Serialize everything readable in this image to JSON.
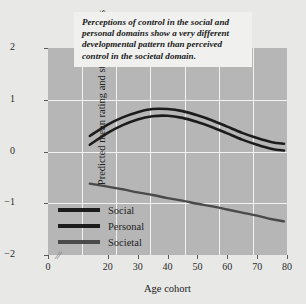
{
  "chart_data": {
    "type": "line",
    "title": "",
    "annotation": "Perceptions of control in the social and personal domains show a very different developmental pattern than perceived control in the societal domain.",
    "xlabel": "Age cohort",
    "ylabel": "Predicted mean rating and standard errors",
    "xlim": [
      0,
      80
    ],
    "ylim": [
      -2,
      2
    ],
    "x_ticks": [
      0,
      20,
      30,
      40,
      50,
      60,
      70,
      80
    ],
    "y_ticks": [
      2,
      1,
      0,
      -1,
      -2
    ],
    "x_tick_labels": [
      "0",
      "20",
      "30",
      "40",
      "50",
      "60",
      "70",
      "80"
    ],
    "y_tick_labels": [
      "2",
      "1",
      "0",
      "−1",
      "−2"
    ],
    "grid": true,
    "axis_break": true,
    "legend_position": "lower-left",
    "x": [
      14,
      20,
      25,
      30,
      35,
      40,
      45,
      50,
      55,
      60,
      65,
      70,
      75,
      79
    ],
    "series": [
      {
        "name": "Social",
        "color": "#1c1c1c",
        "values": [
          0.3,
          0.52,
          0.66,
          0.76,
          0.82,
          0.82,
          0.78,
          0.7,
          0.6,
          0.48,
          0.36,
          0.26,
          0.18,
          0.15
        ]
      },
      {
        "name": "Personal",
        "color": "#1c1c1c",
        "values": [
          0.13,
          0.36,
          0.51,
          0.62,
          0.68,
          0.69,
          0.65,
          0.57,
          0.47,
          0.35,
          0.23,
          0.13,
          0.05,
          0.02
        ]
      },
      {
        "name": "Societal",
        "color": "#4a4a4a",
        "values": [
          -0.62,
          -0.68,
          -0.73,
          -0.79,
          -0.84,
          -0.9,
          -0.95,
          -1.01,
          -1.06,
          -1.12,
          -1.18,
          -1.24,
          -1.31,
          -1.35
        ]
      }
    ]
  },
  "legend": {
    "items": [
      {
        "label": "Social",
        "color": "#1c1c1c"
      },
      {
        "label": "Personal",
        "color": "#1c1c1c"
      },
      {
        "label": "Societal",
        "color": "#4a4a4a"
      }
    ]
  },
  "colors": {
    "plot_background": "#b6b6b6",
    "page_background": "#e8e8e6",
    "gridline": "#f2f2f0",
    "annotation_background": "#f0f0ee"
  }
}
